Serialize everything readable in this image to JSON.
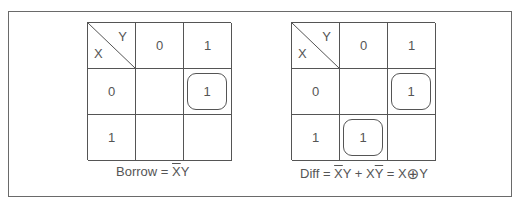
{
  "diagram": {
    "title_cut": "",
    "kmaps": [
      {
        "id": "borrow",
        "corner": {
          "row_var": "X",
          "col_var": "Y"
        },
        "col_headers": [
          "0",
          "1"
        ],
        "row_headers": [
          "0",
          "1"
        ],
        "cells": [
          [
            "",
            "1"
          ],
          [
            "",
            ""
          ]
        ],
        "grouped_cells": [
          [
            0,
            1
          ]
        ],
        "caption": {
          "label": "Borrow",
          "equals": "=",
          "term1_bar": "X",
          "term1_plain": "Y"
        }
      },
      {
        "id": "diff",
        "corner": {
          "row_var": "X",
          "col_var": "Y"
        },
        "col_headers": [
          "0",
          "1"
        ],
        "row_headers": [
          "0",
          "1"
        ],
        "cells": [
          [
            "",
            "1"
          ],
          [
            "1",
            ""
          ]
        ],
        "grouped_cells": [
          [
            0,
            1
          ],
          [
            1,
            0
          ]
        ],
        "caption": {
          "label": "Diff",
          "equals": "=",
          "term1_bar": "X",
          "term1_plain": "Y",
          "plus": "+",
          "term2_plain": "X",
          "term2_bar": "Y",
          "equals2": "=",
          "xor_left": "X",
          "xor_symbol": "⊕",
          "xor_right": "Y"
        }
      }
    ],
    "colors": {
      "line": "#555555",
      "text": "#555555",
      "frame": "#6a6a6a",
      "background": "#ffffff"
    }
  }
}
